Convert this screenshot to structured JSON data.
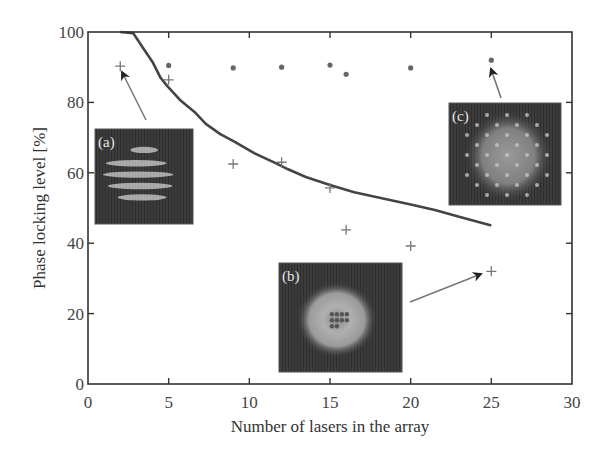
{
  "chart_data": {
    "type": "scatter",
    "title": "",
    "xlabel": "Number of lasers in the array",
    "ylabel": "Phase locking level [%]",
    "xlim": [
      0,
      30
    ],
    "ylim": [
      0,
      100
    ],
    "xticks": [
      0,
      5,
      10,
      15,
      20,
      25,
      30
    ],
    "yticks": [
      0,
      20,
      40,
      60,
      80,
      100
    ],
    "grid": false,
    "legend": null,
    "series": [
      {
        "name": "dots",
        "marker": "circle",
        "x": [
          5,
          9,
          12,
          15,
          16,
          20,
          25
        ],
        "y": [
          90.5,
          89.8,
          90,
          90.6,
          88,
          89.8,
          92
        ]
      },
      {
        "name": "plus",
        "marker": "plus",
        "x": [
          2,
          5,
          9,
          12,
          15,
          16,
          20,
          25
        ],
        "y": [
          90.3,
          86.4,
          62.5,
          63,
          55.7,
          43.8,
          39.2,
          32
        ]
      },
      {
        "name": "curve",
        "marker": "line",
        "x": [
          2,
          2.8,
          3.4,
          4.0,
          4.5,
          4.9,
          5.7,
          6.6,
          7.3,
          8.2,
          9.1,
          10.3,
          11.6,
          12.4,
          13.5,
          15.0,
          16.5,
          18.0,
          20.0,
          21.5,
          23.0,
          25.0
        ],
        "y": [
          100,
          99.7,
          95.5,
          91.5,
          87,
          84.7,
          80.7,
          77.3,
          73.9,
          71,
          68.8,
          65.6,
          62.8,
          61,
          58.8,
          56.5,
          54.5,
          53,
          51,
          49.4,
          47.5,
          45
        ]
      }
    ],
    "annotations": [
      {
        "label": "(a)",
        "description": "far-field image with horizontal fringes",
        "points_to": {
          "x": 2,
          "y": 90.3
        }
      },
      {
        "label": "(b)",
        "description": "far-field image, diffuse ring",
        "points_to": {
          "x": 25,
          "y": 32
        }
      },
      {
        "label": "(c)",
        "description": "far-field image, speckle lattice",
        "points_to": {
          "x": 25,
          "y": 92
        }
      }
    ]
  },
  "colors": {
    "axis": "#333333",
    "markers": "#666666",
    "curve": "#444444",
    "arrow": "#777777",
    "inset_bg": "#3a3a3a"
  }
}
